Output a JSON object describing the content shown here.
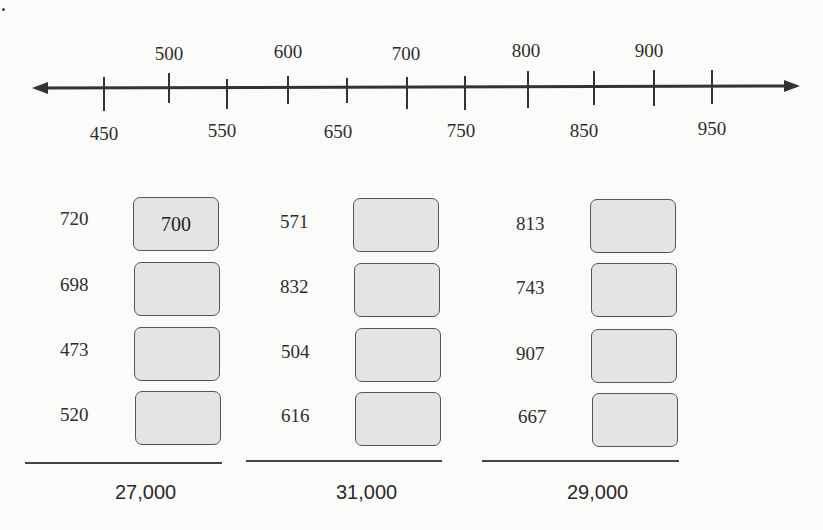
{
  "number_line": {
    "min": 450,
    "max": 950,
    "step": 50,
    "labels_above": [
      "500",
      "600",
      "700",
      "800",
      "900"
    ],
    "labels_below": [
      "450",
      "550",
      "650",
      "750",
      "850",
      "950"
    ]
  },
  "problems": [
    {
      "addends": [
        "720",
        "698",
        "473",
        "520"
      ],
      "rounded_answers": [
        "700",
        "",
        "",
        ""
      ],
      "estimated_total": "27,000"
    },
    {
      "addends": [
        "571",
        "832",
        "504",
        "616"
      ],
      "rounded_answers": [
        "",
        "",
        "",
        ""
      ],
      "estimated_total": "31,000"
    },
    {
      "addends": [
        "813",
        "743",
        "907",
        "667"
      ],
      "rounded_answers": [
        "",
        "",
        "",
        ""
      ],
      "estimated_total": "29,000"
    }
  ]
}
